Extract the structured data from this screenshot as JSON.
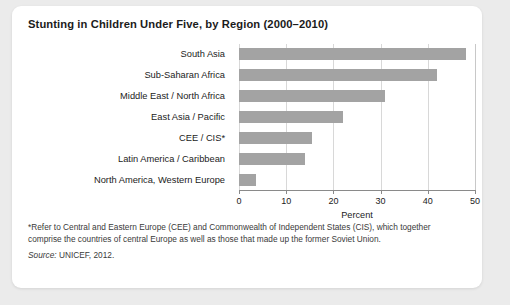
{
  "card": {
    "title": "Stunting in Children Under Five, by Region (2000–2010)",
    "footnote": "*Refer to Central and Eastern Europe (CEE) and Commonwealth of Independent States (CIS), which together comprise the countries of central Europe as well as those that made up the former Soviet Union.",
    "source_word": "Source:",
    "source_text": " UNICEF, 2012."
  },
  "colors": {
    "bar": "#a3a3a3",
    "gridline": "#d8d8d8",
    "axis": "#8a8a8a",
    "page_background": "#ebebeb",
    "card_background": "#ffffff",
    "text": "#1b1b1b"
  },
  "chart_data": {
    "type": "bar",
    "orientation": "horizontal",
    "title": "Stunting in Children Under Five, by Region (2000–2010)",
    "categories": [
      "South Asia",
      "Sub-Saharan Africa",
      "Middle East / North Africa",
      "East Asia / Pacific",
      "CEE / CIS*",
      "Latin America / Caribbean",
      "North America, Western Europe"
    ],
    "values": [
      48,
      42,
      31,
      22,
      15.5,
      14,
      3.5
    ],
    "xlabel": "Percent",
    "ylabel": "",
    "xlim": [
      0,
      50
    ],
    "xticks": [
      0,
      10,
      20,
      30,
      40,
      50
    ],
    "xticklabels": [
      "0",
      "10",
      "20",
      "30",
      "40",
      "50"
    ],
    "grid": "vertical",
    "legend": "none"
  }
}
